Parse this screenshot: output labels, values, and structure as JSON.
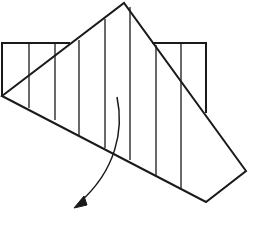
{
  "diagram": {
    "stroke_color": "#1a1a1a",
    "background": "#ffffff",
    "back_rectangle_left": {
      "points": "2,43 70,43"
    },
    "back_rectangle_outline": {
      "left_part": "70,43 2,43 2,96",
      "right_part": "152,43 206,43 206,113"
    },
    "folded_flap": {
      "points": "2,96 124,3 246,171 206,202"
    },
    "crease_lines": [
      {
        "x": 29,
        "y1": 43,
        "y2": 108
      },
      {
        "x": 55,
        "y1": 43,
        "y2": 120
      },
      {
        "x": 79,
        "y1": 40,
        "y2": 136
      },
      {
        "x": 105,
        "y1": 19,
        "y2": 148
      },
      {
        "x": 130,
        "y1": 7,
        "y2": 160
      },
      {
        "x": 156,
        "y1": 45,
        "y2": 176
      },
      {
        "x": 181,
        "y1": 43,
        "y2": 188
      }
    ],
    "arrow": {
      "path": "M117,97 C124,130 116,170 80,202",
      "head": "74,208 84,196 87,205"
    }
  }
}
